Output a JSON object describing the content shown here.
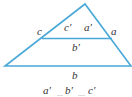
{
  "diagram": {
    "stroke_color": "#4aa8d8",
    "labels": {
      "c": "c",
      "c_prime": "c′",
      "a_prime": "a′",
      "a": "a",
      "b_prime": "b′",
      "b": "b"
    },
    "ratio": [
      "a′",
      "b′",
      "c′"
    ]
  }
}
